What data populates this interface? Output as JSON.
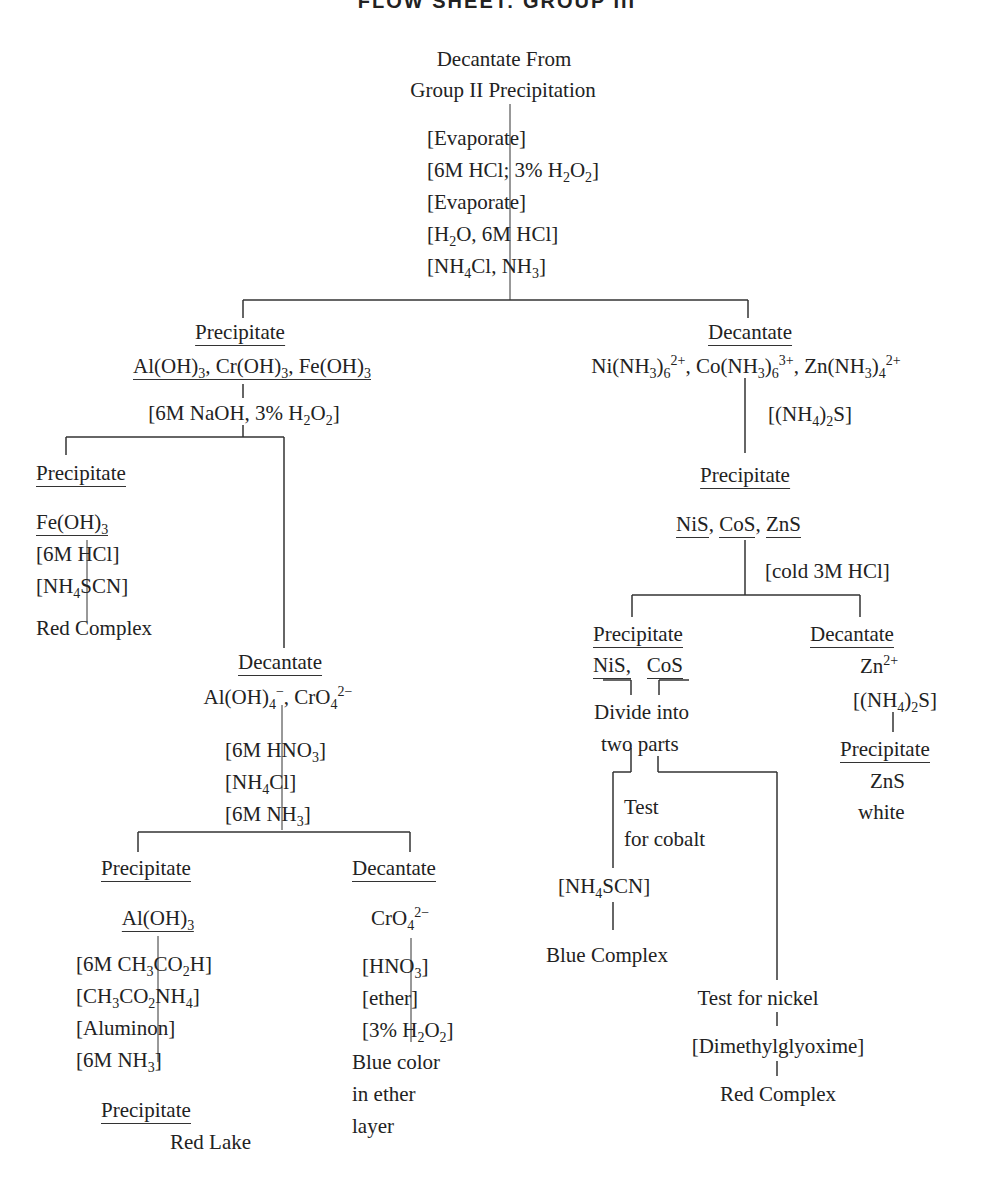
{
  "title": "FLOW SHEET: GROUP III",
  "start": {
    "line1": "Decantate From",
    "line2": "Group II Precipitation",
    "reagents": [
      "[Evaporate]",
      "[6M HCl; 3% H<sub>2</sub>O<sub>2</sub>]",
      "[Evaporate]",
      "[H<sub>2</sub>O, 6M HCl]",
      "[NH<sub>4</sub>Cl, NH<sub>3</sub>]"
    ]
  },
  "left_branch": {
    "label": "Precipitate",
    "species": "Al(OH)<sub>3</sub>, Cr(OH)<sub>3</sub>, Fe(OH)<sub>3</sub>",
    "reagent": "[6M NaOH, 3% H<sub>2</sub>O<sub>2</sub>]",
    "iron": {
      "label": "Precipitate",
      "species": "Fe(OH)<sub>3</sub>",
      "reagents": [
        "[6M HCl]",
        "[NH<sub>4</sub>SCN]"
      ],
      "result": "Red Complex"
    },
    "decantate": {
      "label": "Decantate",
      "species": "Al(OH)<sub>4</sub><sup>&minus;</sup>, CrO<sub>4</sub><sup>2&minus;</sup>",
      "reagents": [
        "[6M HNO<sub>3</sub>]",
        "[NH<sub>4</sub>Cl]",
        "[6M NH<sub>3</sub>]"
      ],
      "aluminum": {
        "label": "Precipitate",
        "species": "Al(OH)<sub>3</sub>",
        "reagents": [
          "[6M CH<sub>3</sub>CO<sub>2</sub>H]",
          "[CH<sub>3</sub>CO<sub>2</sub>NH<sub>4</sub>]",
          "[Aluminon]",
          "[6M NH<sub>3</sub>]"
        ],
        "result_label": "Precipitate",
        "result": "Red Lake"
      },
      "chromium": {
        "label": "Decantate",
        "species": "CrO<sub>4</sub><sup>2&minus;</sup>",
        "reagents": [
          "[HNO<sub>3</sub>]",
          "[ether]",
          "[3% H<sub>2</sub>O<sub>2</sub>]"
        ],
        "result": [
          "Blue color",
          "in ether",
          "layer"
        ]
      }
    }
  },
  "right_branch": {
    "label": "Decantate",
    "species": "Ni(NH<sub>3</sub>)<sub>6</sub><sup>2+</sup>, Co(NH<sub>3</sub>)<sub>6</sub><sup>3+</sup>, Zn(NH<sub>3</sub>)<sub>4</sub><sup>2+</sup>",
    "reagent": "[(NH<sub>4</sub>)<sub>2</sub>S]",
    "precipitate": {
      "label": "Precipitate",
      "species": [
        "NiS",
        "CoS",
        "ZnS"
      ],
      "reagent": "[cold 3M HCl]",
      "nico": {
        "label": "Precipitate",
        "species": [
          "NiS,",
          "CoS"
        ],
        "divide": [
          "Divide into",
          "two parts"
        ],
        "cobalt": {
          "label": [
            "Test",
            "for cobalt"
          ],
          "reagent": "[NH<sub>4</sub>SCN]",
          "result": "Blue Complex"
        },
        "nickel": {
          "label": "Test for nickel",
          "reagent": "[Dimethylglyoxime]",
          "result": "Red Complex"
        }
      },
      "zinc": {
        "label": "Decantate",
        "species": "Zn<sup>2+</sup>",
        "reagent": "[(NH<sub>4</sub>)<sub>2</sub>S]",
        "result_label": "Precipitate",
        "result": [
          "ZnS",
          "white"
        ]
      }
    }
  }
}
